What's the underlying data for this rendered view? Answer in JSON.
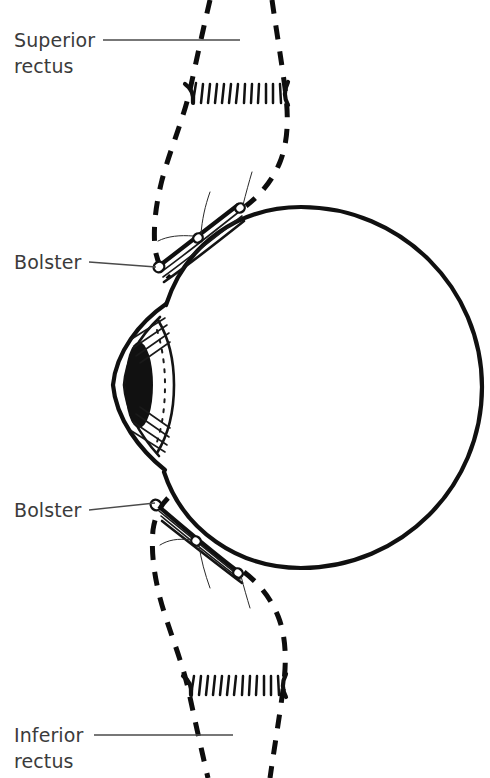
{
  "figure": {
    "background_color": "#ffffff",
    "ink_color": "#101010",
    "label_color": "#3b3b3b"
  },
  "labels": [
    {
      "id": "superior-rectus",
      "line1": "Superior",
      "line2": "rectus",
      "leader": "horizontal line running right from label to the superior rectus muscle"
    },
    {
      "id": "bolster-upper",
      "line1": "Bolster",
      "line2": "",
      "leader": "line running right and slightly down to the upper bolster suture knot"
    },
    {
      "id": "bolster-lower",
      "line1": "Bolster",
      "line2": "",
      "leader": "line running right and slightly up to the lower bolster suture knot"
    },
    {
      "id": "inferior-rectus",
      "line1": "Inferior",
      "line2": "rectus",
      "leader": "horizontal line running right from label to the inferior rectus muscle"
    }
  ],
  "structures": {
    "globe": {
      "name": "eye globe",
      "shape": "large circle, solid heavy outline",
      "center_x": 301,
      "center_y": 387,
      "radius": 181
    },
    "cornea": {
      "name": "cornea",
      "shape": "leaf / lens profile projecting to the left of the globe",
      "apex_x": 112,
      "apex_y": 385
    },
    "pupil": {
      "name": "pupil and iris",
      "shape": "dark filled vertical ellipse",
      "center_x": 137,
      "center_y": 385
    },
    "limbus": {
      "name": "limbus",
      "shape": "fine dash-dot vertical line at the corneal margin",
      "x": 152
    },
    "superior_rectus": {
      "name": "superior rectus muscle",
      "shape": "dashed outline muscle belly running up from the globe, with a hatched cut edge band",
      "comb_y": 92
    },
    "inferior_rectus": {
      "name": "inferior rectus muscle",
      "shape": "dashed outline muscle belly running down from the globe, with a hatched cut edge band",
      "comb_y": 684
    },
    "bolster_upper": {
      "name": "upper bolster",
      "shape": "striped band lying on the sclera with two suture knots and thread tails"
    },
    "bolster_lower": {
      "name": "lower bolster",
      "shape": "striped band lying on the sclera with two suture knots and thread tails"
    }
  }
}
